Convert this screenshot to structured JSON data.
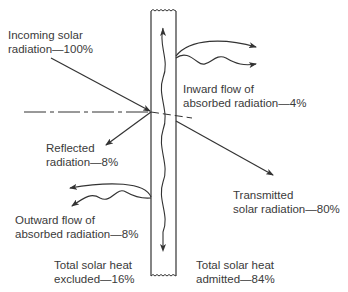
{
  "diagram": {
    "labels": {
      "incoming": {
        "line1": "Incoming solar",
        "line2": "radiation—100%"
      },
      "inward": {
        "line1": "Inward flow of",
        "line2": "absorbed radiation—4%"
      },
      "reflected": {
        "line1": "Reflected",
        "line2": "radiation—8%"
      },
      "transmitted": {
        "line1": "Transmitted",
        "line2": "solar radiation—80%"
      },
      "outward": {
        "line1": "Outward flow of",
        "line2": "absorbed radiation—8%"
      },
      "excluded": {
        "line1": "Total solar heat",
        "line2": "excluded—16%"
      },
      "admitted": {
        "line1": "Total solar heat",
        "line2": "admitted—84%"
      }
    },
    "values": {
      "incoming_pct": 100,
      "reflected_pct": 8,
      "transmitted_pct": 80,
      "inward_absorbed_pct": 4,
      "outward_absorbed_pct": 8,
      "total_excluded_pct": 16,
      "total_admitted_pct": 84
    },
    "colors": {
      "line": "#333333",
      "text": "#3a3a3a",
      "background": "#ffffff"
    }
  }
}
